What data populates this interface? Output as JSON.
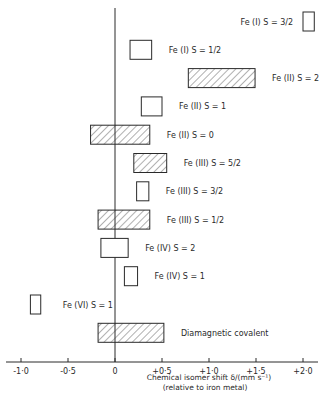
{
  "chart_data": {
    "type": "range-bar",
    "title": "",
    "xlabel": "Chemical isomer shift δ/(mm s⁻¹)",
    "xlabel_sub": "(relative to iron metal)",
    "ylabel": "",
    "xlim": [
      -1.1,
      2.2
    ],
    "grid": false,
    "legend": "none (labels beside bars)",
    "x_ticks": [
      -1.0,
      -0.5,
      0,
      0.5,
      1.0,
      1.5,
      2.0
    ],
    "x_tick_labels": [
      "-1·0",
      "-0·5",
      "0",
      "+0·5",
      "+1·0",
      "+1·5",
      "+2·0"
    ],
    "reference_line": 0,
    "series": [
      {
        "name": "Fe(I) S=3/2",
        "ion": "Fe (I)",
        "spin": "S = 3/2",
        "min": 2.0,
        "max": 2.12,
        "hatched": false,
        "label_side": "left"
      },
      {
        "name": "Fe(I) S=1/2",
        "ion": "Fe (I)",
        "spin": "S = 1/2",
        "min": 0.16,
        "max": 0.39,
        "hatched": false,
        "label_side": "right"
      },
      {
        "name": "Fe(II) S=2",
        "ion": "Fe (II)",
        "spin": "S = 2",
        "min": 0.78,
        "max": 1.49,
        "hatched": true,
        "label_side": "right"
      },
      {
        "name": "Fe(II) S=1",
        "ion": "Fe (II)",
        "spin": "S = 1",
        "min": 0.28,
        "max": 0.5,
        "hatched": false,
        "label_side": "right"
      },
      {
        "name": "Fe(II) S=0",
        "ion": "Fe (II)",
        "spin": "S = 0",
        "min": -0.26,
        "max": 0.37,
        "hatched": true,
        "label_side": "right"
      },
      {
        "name": "Fe(III) S=5/2",
        "ion": "Fe (III)",
        "spin": "S = 5/2",
        "min": 0.2,
        "max": 0.55,
        "hatched": true,
        "label_side": "right"
      },
      {
        "name": "Fe(III) S=3/2",
        "ion": "Fe (III)",
        "spin": "S = 3/2",
        "min": 0.23,
        "max": 0.36,
        "hatched": false,
        "label_side": "right"
      },
      {
        "name": "Fe(III) S=1/2",
        "ion": "Fe (III)",
        "spin": "S = 1/2",
        "min": -0.18,
        "max": 0.37,
        "hatched": true,
        "label_side": "right"
      },
      {
        "name": "Fe(IV) S=2",
        "ion": "Fe (IV)",
        "spin": "S = 2",
        "min": -0.15,
        "max": 0.14,
        "hatched": false,
        "label_side": "right"
      },
      {
        "name": "Fe(IV) S=1",
        "ion": "Fe (IV)",
        "spin": "S = 1",
        "min": 0.1,
        "max": 0.24,
        "hatched": false,
        "label_side": "right"
      },
      {
        "name": "Fe(VI) S=1",
        "ion": "Fe (VI)",
        "spin": "S = 1",
        "min": -0.9,
        "max": -0.79,
        "hatched": false,
        "label_side": "right"
      },
      {
        "name": "Diamagnetic covalent",
        "ion": "Diamagnetic covalent",
        "spin": "",
        "min": -0.18,
        "max": 0.52,
        "hatched": true,
        "label_side": "right"
      }
    ]
  },
  "colors": {
    "ink": "#2a2a2a",
    "background": "#ffffff"
  }
}
